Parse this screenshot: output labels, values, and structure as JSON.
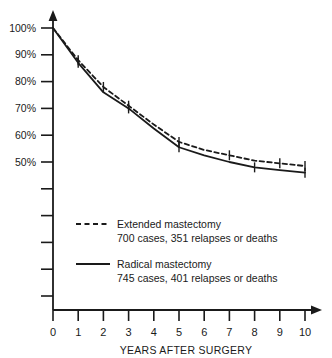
{
  "chart_data": {
    "type": "line",
    "title": "",
    "xlabel": "YEARS AFTER SURGERY",
    "ylabel": "",
    "xlim": [
      0,
      10
    ],
    "ylim": [
      40,
      100
    ],
    "grid": false,
    "legend_position": "inside-lower-left",
    "x": [
      0,
      1,
      2,
      3,
      4,
      5,
      6,
      7,
      8,
      9,
      10
    ],
    "xticklabels": [
      "0",
      "1",
      "2",
      "3",
      "4",
      "5",
      "6",
      "7",
      "8",
      "9",
      "10"
    ],
    "yticklabels": [
      "100%",
      "90%",
      "80%",
      "70%",
      "60%",
      "50%"
    ],
    "ytickvalues": [
      100,
      90,
      80,
      70,
      60,
      50
    ],
    "series": [
      {
        "name": "Extended mastectomy",
        "style": "dashed",
        "color": "#1a1a1a",
        "values": [
          100,
          88,
          78,
          71,
          64,
          57.5,
          54.5,
          52.5,
          50.5,
          49.5,
          48.5
        ],
        "errorbar_years": [
          1,
          2,
          3,
          5,
          7,
          9,
          10
        ]
      },
      {
        "name": "Radical mastectomy",
        "style": "solid",
        "color": "#1a1a1a",
        "values": [
          100,
          87,
          76,
          70,
          62.5,
          55.5,
          52.5,
          50,
          48,
          47,
          46
        ],
        "errorbar_years": [
          1,
          3,
          5,
          8,
          10
        ]
      }
    ]
  },
  "axes": {
    "x_title": "YEARS AFTER SURGERY",
    "x_ticks": [
      "0",
      "1",
      "2",
      "3",
      "4",
      "5",
      "6",
      "7",
      "8",
      "9",
      "10"
    ],
    "y_ticks": [
      "100%",
      "90%",
      "80%",
      "70%",
      "60%",
      "50%"
    ]
  },
  "legend": {
    "entries": [
      {
        "line_style": "dashed",
        "label": "Extended mastectomy",
        "detail": "700 cases, 351 relapses or deaths"
      },
      {
        "line_style": "solid",
        "label": "Radical mastectomy",
        "detail": "745 cases, 401 relapses or deaths"
      }
    ]
  },
  "colors": {
    "ink": "#1a1a1a",
    "background": "#ffffff"
  }
}
